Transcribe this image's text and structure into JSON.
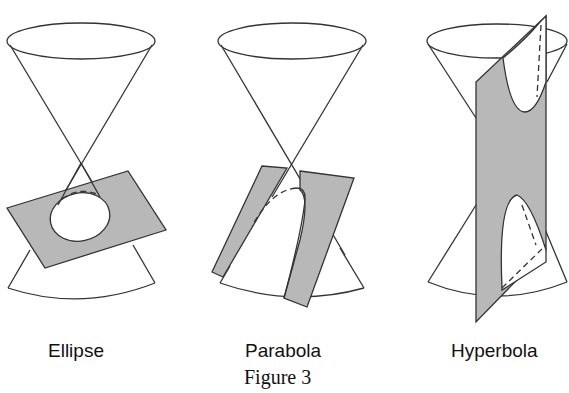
{
  "figure": {
    "caption": "Figure 3",
    "panels": [
      {
        "id": "ellipse",
        "label": "Ellipse",
        "description": "Double cone cut by a tilted plane producing a closed ellipse"
      },
      {
        "id": "parabola",
        "label": "Parabola",
        "description": "Double cone cut by a plane parallel to a generator producing a parabola"
      },
      {
        "id": "hyperbola",
        "label": "Hyperbola",
        "description": "Double cone cut by a vertical plane producing two hyperbola branches"
      }
    ]
  },
  "colors": {
    "stroke": "#333333",
    "plane_fill": "#b8b8b8",
    "background": "#ffffff"
  }
}
